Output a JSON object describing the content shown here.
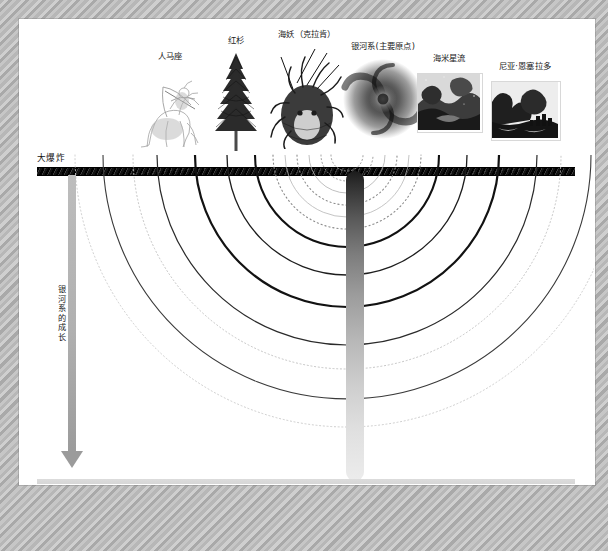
{
  "figure": {
    "type": "timeline-diagram",
    "top_axis_label": "大爆炸",
    "bottom_axis_label": "现今",
    "vertical_axis_label": "银河系的成长",
    "colors": {
      "frame": "#bdbdbd",
      "canvas": "#ffffff",
      "bigbang_bar": "#000000",
      "today_bar": "#d6d6d6",
      "arrow": "#a8a8a8",
      "column_top": "#1b1b1b",
      "column_bottom": "#ececec"
    }
  },
  "specimens": [
    {
      "label": "人马座",
      "icon": "sagittarius-centaur-engraving"
    },
    {
      "label": "红杉",
      "icon": "redwood-tree-engraving"
    },
    {
      "label": "海妖（克拉肯）",
      "icon": "kraken-sea-monster-engraving"
    },
    {
      "label": "银河系(主要原点)",
      "icon": "spiral-galaxy-photo"
    },
    {
      "label": "海米星流",
      "icon": "starry-landscape-photo"
    },
    {
      "label": "尼亚·恩塞拉多",
      "icon": "rocky-ruins-photo"
    }
  ],
  "chart_data": {
    "type": "line",
    "title": "银河系的成长",
    "xlabel": "",
    "ylabel": "",
    "axis_top": "大爆炸",
    "axis_bottom": "现今",
    "origin_x": 347,
    "note": "嵌套的 U 形弧线代表各星流自大爆炸起向现今汇聚于主要原点",
    "series": [
      {
        "name": "arc-1",
        "style": "dotted",
        "radius": 16,
        "stroke": "#9a9a9a",
        "width": 1.0
      },
      {
        "name": "arc-2",
        "style": "dotted",
        "radius": 26,
        "stroke": "#9a9a9a",
        "width": 1.0
      },
      {
        "name": "arc-3",
        "style": "solid-thin",
        "radius": 38,
        "stroke": "#b0b0b0",
        "width": 0.8
      },
      {
        "name": "arc-4",
        "style": "dotted",
        "radius": 50,
        "stroke": "#8f8f8f",
        "width": 1.1
      },
      {
        "name": "arc-5",
        "style": "solid-thin",
        "radius": 62,
        "stroke": "#b5b5b5",
        "width": 0.8
      },
      {
        "name": "arc-6",
        "style": "dotted",
        "radius": 74,
        "stroke": "#8a8a8a",
        "width": 1.1
      },
      {
        "name": "arc-7",
        "style": "solid-bold",
        "radius": 92,
        "stroke": "#111111",
        "width": 2.1
      },
      {
        "name": "arc-8",
        "style": "solid",
        "radius": 120,
        "stroke": "#1d1d1d",
        "width": 1.3
      },
      {
        "name": "arc-9",
        "style": "solid-bold",
        "radius": 152,
        "stroke": "#121212",
        "width": 2.2
      },
      {
        "name": "arc-10",
        "style": "solid",
        "radius": 190,
        "stroke": "#2a2a2a",
        "width": 1.2
      },
      {
        "name": "arc-11",
        "style": "dotted",
        "radius": 214,
        "stroke": "#c4c4c4",
        "width": 1.0
      },
      {
        "name": "arc-12",
        "style": "solid",
        "radius": 244,
        "stroke": "#3a3a3a",
        "width": 1.1
      },
      {
        "name": "arc-13",
        "style": "dotted",
        "radius": 272,
        "stroke": "#cdcdcd",
        "width": 1.0
      }
    ]
  }
}
